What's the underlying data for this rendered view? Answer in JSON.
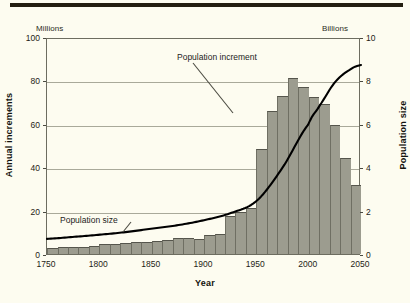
{
  "figure": {
    "top_rule_color": "#241f10",
    "background_color": "#fdfcf0",
    "bar_color": "#9c9c8f",
    "curve_color": "#000000",
    "grid_color": "#a9a99a"
  },
  "chart_data": {
    "type": "bar",
    "title": "",
    "subtitle": "",
    "xlabel": "Year",
    "ylabel": "Annual increments",
    "y2label": "Population size",
    "y_unit_label": "Millions",
    "y2_unit_label": "Billions",
    "ylim": [
      0,
      100
    ],
    "y2lim": [
      0,
      10
    ],
    "xlim": [
      1750,
      2050
    ],
    "xticks": [
      1750,
      1800,
      1850,
      1900,
      1950,
      2000,
      2050
    ],
    "yticks": [
      0,
      20,
      40,
      60,
      80,
      100
    ],
    "y2ticks": [
      0,
      2,
      4,
      6,
      8,
      10
    ],
    "grid": "horizontal",
    "legend_position": "inline-annotations",
    "annotations": [
      {
        "text": "Population increment",
        "target": "bar-1955"
      },
      {
        "text": "Population size",
        "target": "population-curve"
      }
    ],
    "series": [
      {
        "name": "Population increment",
        "unit": "Millions per year",
        "type": "bar",
        "axis": "left",
        "bin_width": 10,
        "x": [
          1750,
          1760,
          1770,
          1780,
          1790,
          1800,
          1810,
          1820,
          1830,
          1840,
          1850,
          1860,
          1870,
          1880,
          1890,
          1900,
          1910,
          1920,
          1930,
          1940,
          1950,
          1960,
          1970,
          1980,
          1990,
          2000,
          2010,
          2020,
          2030,
          2040
        ],
        "values": [
          3.0,
          3.3,
          3.3,
          3.4,
          3.6,
          4.6,
          4.6,
          5.1,
          5.7,
          5.6,
          6.1,
          6.4,
          7.3,
          7.4,
          7.0,
          9.0,
          9.3,
          17.5,
          19.6,
          21.0,
          48.5,
          65.8,
          73.0,
          81.0,
          77.2,
          72.2,
          69.0,
          59.4,
          44.2,
          32.0
        ]
      },
      {
        "name": "Population size",
        "unit": "Billions",
        "type": "line",
        "axis": "right",
        "x": [
          1750,
          1775,
          1800,
          1825,
          1850,
          1875,
          1900,
          1925,
          1950,
          1975,
          2000,
          2010,
          2025,
          2040,
          2050
        ],
        "values": [
          0.79,
          0.88,
          0.98,
          1.1,
          1.26,
          1.42,
          1.65,
          1.97,
          2.53,
          4.07,
          6.08,
          6.9,
          8.0,
          8.6,
          8.8
        ]
      }
    ]
  }
}
